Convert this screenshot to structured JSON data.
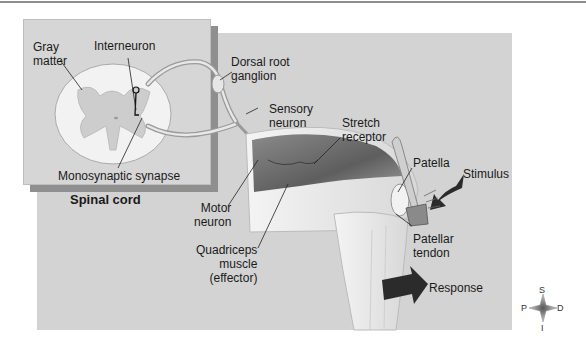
{
  "figure": {
    "labels": {
      "gray_matter": [
        "Gray",
        "matter"
      ],
      "interneuron": "Interneuron",
      "dorsal_root_ganglion": [
        "Dorsal root",
        "ganglion"
      ],
      "sensory_neuron": [
        "Sensory",
        "neuron"
      ],
      "stretch_receptor": [
        "Stretch",
        "receptor"
      ],
      "patella": "Patella",
      "stimulus": "Stimulus",
      "monosynaptic_synapse": "Monosynaptic synapse",
      "spinal_cord": "Spinal cord",
      "motor_neuron": [
        "Motor",
        "neuron"
      ],
      "quadriceps": [
        "Quadriceps",
        "muscle",
        "(effector)"
      ],
      "patellar_tendon": [
        "Patellar",
        "tendon"
      ],
      "response": "Response"
    },
    "compass": {
      "superior": "S",
      "inferior": "I",
      "proximal": "P",
      "distal": "D"
    },
    "colors": {
      "panel": "#d3d3d3",
      "inset": "#d6d6d6",
      "inset_shadow": "#8f8f8f",
      "muscle": "#6e6e6e",
      "arrow": "#2b2b2b",
      "leg": "#ececec"
    }
  }
}
